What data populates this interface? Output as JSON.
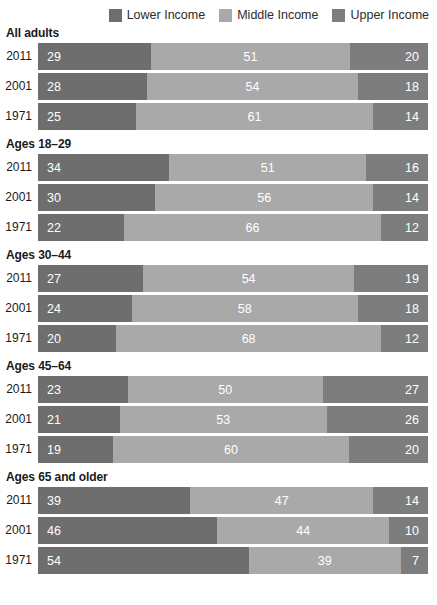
{
  "legend": {
    "items": [
      {
        "label": "Lower Income",
        "color": "#6e6e6e",
        "swatch_name": "legend-swatch-lower-income"
      },
      {
        "label": "Middle Income",
        "color": "#a9a9a9",
        "swatch_name": "legend-swatch-middle-income"
      },
      {
        "label": "Upper Income",
        "color": "#7d7d7d",
        "swatch_name": "legend-swatch-upper-income"
      }
    ]
  },
  "chart_data": {
    "type": "bar",
    "title": "",
    "subtitle": "",
    "xlabel": "",
    "ylabel": "",
    "xlim": [
      0,
      100
    ],
    "grid": false,
    "legend_position": "top-right",
    "orientation": "horizontal",
    "stacked": true,
    "value_unit": "%",
    "series": [
      {
        "name": "Lower Income",
        "color": "#6e6e6e"
      },
      {
        "name": "Middle Income",
        "color": "#a9a9a9"
      },
      {
        "name": "Upper Income",
        "color": "#7d7d7d"
      }
    ],
    "groups": [
      {
        "label": "All adults",
        "rows": [
          {
            "category": "2011",
            "values": [
              29,
              51,
              20
            ]
          },
          {
            "category": "2001",
            "values": [
              28,
              54,
              18
            ]
          },
          {
            "category": "1971",
            "values": [
              25,
              61,
              14
            ]
          }
        ]
      },
      {
        "label": "Ages 18–29",
        "rows": [
          {
            "category": "2011",
            "values": [
              34,
              51,
              16
            ]
          },
          {
            "category": "2001",
            "values": [
              30,
              56,
              14
            ]
          },
          {
            "category": "1971",
            "values": [
              22,
              66,
              12
            ]
          }
        ]
      },
      {
        "label": "Ages 30–44",
        "rows": [
          {
            "category": "2011",
            "values": [
              27,
              54,
              19
            ]
          },
          {
            "category": "2001",
            "values": [
              24,
              58,
              18
            ]
          },
          {
            "category": "1971",
            "values": [
              20,
              68,
              12
            ]
          }
        ]
      },
      {
        "label": "Ages 45–64",
        "rows": [
          {
            "category": "2011",
            "values": [
              23,
              50,
              27
            ]
          },
          {
            "category": "2001",
            "values": [
              21,
              53,
              26
            ]
          },
          {
            "category": "1971",
            "values": [
              19,
              60,
              20
            ]
          }
        ]
      },
      {
        "label": "Ages 65 and older",
        "rows": [
          {
            "category": "2011",
            "values": [
              39,
              47,
              14
            ]
          },
          {
            "category": "2001",
            "values": [
              46,
              44,
              10
            ]
          },
          {
            "category": "1971",
            "values": [
              54,
              39,
              7
            ]
          }
        ]
      }
    ]
  }
}
